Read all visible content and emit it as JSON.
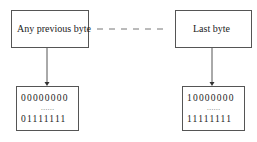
{
  "diagram": {
    "left": {
      "top_label": "Any previous byte",
      "range_start": "00000000",
      "ellipsis": "......",
      "range_end": "01111111"
    },
    "right": {
      "top_label": "Last byte",
      "range_start": "10000000",
      "ellipsis": "......",
      "range_end": "11111111"
    },
    "connector": "dashed-line"
  }
}
